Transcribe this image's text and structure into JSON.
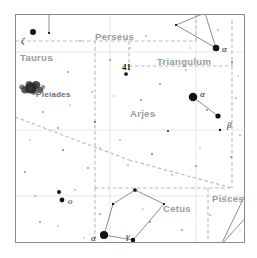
{
  "chart_data": {
    "type": "scatter",
    "xlabel": "",
    "ylabel": "",
    "frame": {
      "x": 15,
      "y": 14,
      "width": 230,
      "height": 229,
      "border_color": "#8a8a8a",
      "background": "#ffffff"
    },
    "constellation_labels": [
      {
        "name": "Perseus",
        "x": 95,
        "y": 31,
        "color": "#9a9a9a"
      },
      {
        "name": "Taurus",
        "x": 20,
        "y": 52,
        "color": "#9a9a9a"
      },
      {
        "name": "Triangulum",
        "x": 157,
        "y": 56,
        "color": "#9a9a9a"
      },
      {
        "name": "Arjes",
        "x": 130,
        "y": 108,
        "color": "#9a9a9a"
      },
      {
        "name": "Cetus",
        "x": 163,
        "y": 203,
        "color": "#9a9a9a"
      },
      {
        "name": "Pisces",
        "x": 212,
        "y": 193,
        "color": "#9a9a9a"
      }
    ],
    "object_labels": [
      {
        "name": "Pleiades",
        "x": 36,
        "y": 90,
        "color": "#6d6d6d"
      }
    ],
    "star_labels": [
      {
        "text": "ζ",
        "x": 21,
        "y": 36,
        "note": "zeta Tauri"
      },
      {
        "text": "41",
        "x": 122,
        "y": 62,
        "note": "41 Arietis",
        "bold": true
      },
      {
        "text": "α",
        "x": 222,
        "y": 44,
        "note": "alpha Trianguli"
      },
      {
        "text": "α",
        "x": 200,
        "y": 89,
        "note": "alpha Arietis / Hamal"
      },
      {
        "text": "β",
        "x": 227,
        "y": 120,
        "note": "beta Arietis"
      },
      {
        "text": "o",
        "x": 68,
        "y": 196,
        "note": "omicron"
      },
      {
        "text": "α",
        "x": 91,
        "y": 233,
        "note": "alpha Ceti"
      },
      {
        "text": "γ",
        "x": 126,
        "y": 231,
        "note": "gamma Ceti"
      }
    ],
    "stars": [
      {
        "x": 33,
        "y": 32,
        "mag": 4.2
      },
      {
        "x": 49,
        "y": 33,
        "mag": 2.4
      },
      {
        "x": 126,
        "y": 74,
        "mag": 3.0
      },
      {
        "x": 205,
        "y": 13,
        "mag": 3.0
      },
      {
        "x": 176,
        "y": 25,
        "mag": 2.4
      },
      {
        "x": 216,
        "y": 48,
        "mag": 4.5
      },
      {
        "x": 193,
        "y": 97,
        "mag": 5.6
      },
      {
        "x": 218,
        "y": 116,
        "mag": 3.8
      },
      {
        "x": 220,
        "y": 130,
        "mag": 2.6
      },
      {
        "x": 59,
        "y": 192,
        "mag": 3.2
      },
      {
        "x": 62,
        "y": 200,
        "mag": 3.6
      },
      {
        "x": 135,
        "y": 190,
        "mag": 3.0
      },
      {
        "x": 113,
        "y": 204,
        "mag": 2.6
      },
      {
        "x": 164,
        "y": 204,
        "mag": 2.4
      },
      {
        "x": 104,
        "y": 235,
        "mag": 5.4
      },
      {
        "x": 133,
        "y": 240,
        "mag": 3.4
      },
      {
        "x": 221,
        "y": 245,
        "mag": 3.0
      },
      {
        "x": 247,
        "y": 191,
        "mag": 3.2
      },
      {
        "x": 168,
        "y": 131,
        "mag": 2.2
      },
      {
        "x": 152,
        "y": 154,
        "mag": 1.6
      },
      {
        "x": 63,
        "y": 150,
        "mag": 1.6
      },
      {
        "x": 95,
        "y": 122,
        "mag": 1.6
      },
      {
        "x": 232,
        "y": 62,
        "mag": 1.6
      },
      {
        "x": 58,
        "y": 128,
        "mag": 1.4
      },
      {
        "x": 88,
        "y": 168,
        "mag": 1.4
      },
      {
        "x": 196,
        "y": 166,
        "mag": 1.4
      },
      {
        "x": 141,
        "y": 100,
        "mag": 1.4
      },
      {
        "x": 110,
        "y": 60,
        "mag": 1.4
      },
      {
        "x": 68,
        "y": 72,
        "mag": 1.4
      },
      {
        "x": 43,
        "y": 112,
        "mag": 1.4
      },
      {
        "x": 100,
        "y": 214,
        "mag": 1.4
      },
      {
        "x": 150,
        "y": 222,
        "mag": 1.4
      },
      {
        "x": 182,
        "y": 230,
        "mag": 1.4
      },
      {
        "x": 40,
        "y": 222,
        "mag": 1.4
      },
      {
        "x": 25,
        "y": 172,
        "mag": 1.4
      },
      {
        "x": 231,
        "y": 157,
        "mag": 1.4
      },
      {
        "x": 207,
        "y": 110,
        "mag": 1.4
      },
      {
        "x": 160,
        "y": 84,
        "mag": 1.4
      },
      {
        "x": 80,
        "y": 41,
        "mag": 1.2
      },
      {
        "x": 146,
        "y": 36,
        "mag": 1.2
      },
      {
        "x": 186,
        "y": 70,
        "mag": 1.2
      },
      {
        "x": 236,
        "y": 98,
        "mag": 1.2
      },
      {
        "x": 120,
        "y": 140,
        "mag": 1.2
      },
      {
        "x": 75,
        "y": 190,
        "mag": 1.2
      },
      {
        "x": 35,
        "y": 196,
        "mag": 1.2
      },
      {
        "x": 210,
        "y": 215,
        "mag": 1.2
      },
      {
        "x": 172,
        "y": 175,
        "mag": 1.2
      },
      {
        "x": 128,
        "y": 165,
        "mag": 1.2
      },
      {
        "x": 92,
        "y": 92,
        "mag": 1.2
      },
      {
        "x": 52,
        "y": 60,
        "mag": 1.2
      },
      {
        "x": 218,
        "y": 30,
        "mag": 1.2
      },
      {
        "x": 240,
        "y": 135,
        "mag": 1.2
      },
      {
        "x": 155,
        "y": 115,
        "mag": 1.0
      },
      {
        "x": 100,
        "y": 148,
        "mag": 1.0
      },
      {
        "x": 70,
        "y": 105,
        "mag": 1.0
      },
      {
        "x": 30,
        "y": 140,
        "mag": 1.0
      },
      {
        "x": 190,
        "y": 48,
        "mag": 1.0
      },
      {
        "x": 238,
        "y": 76,
        "mag": 1.0
      },
      {
        "x": 114,
        "y": 96,
        "mag": 1.0
      },
      {
        "x": 163,
        "y": 63,
        "mag": 1.0
      },
      {
        "x": 200,
        "y": 148,
        "mag": 1.0
      },
      {
        "x": 143,
        "y": 209,
        "mag": 1.0
      },
      {
        "x": 84,
        "y": 238,
        "mag": 1.0
      },
      {
        "x": 58,
        "y": 226,
        "mag": 1.0
      },
      {
        "x": 226,
        "y": 196,
        "mag": 1.0
      },
      {
        "x": 240,
        "y": 230,
        "mag": 1.0
      },
      {
        "x": 20,
        "y": 88,
        "mag": 1.0
      },
      {
        "x": 130,
        "y": 48,
        "mag": 1.0
      }
    ],
    "constellation_lines": [
      {
        "name": "triangulum-a",
        "points": [
          [
            205,
            13
          ],
          [
            216,
            48
          ]
        ]
      },
      {
        "name": "triangulum-b",
        "points": [
          [
            176,
            25
          ],
          [
            216,
            48
          ]
        ]
      },
      {
        "name": "triangulum-c",
        "points": [
          [
            205,
            13
          ],
          [
            176,
            25
          ]
        ]
      },
      {
        "name": "aries",
        "points": [
          [
            193,
            97
          ],
          [
            218,
            116
          ]
        ]
      },
      {
        "name": "cetus-pentagon",
        "points": [
          [
            135,
            190
          ],
          [
            164,
            204
          ],
          [
            133,
            240
          ],
          [
            104,
            235
          ],
          [
            113,
            204
          ],
          [
            135,
            190
          ]
        ]
      },
      {
        "name": "pisces-a",
        "points": [
          [
            221,
            245
          ],
          [
            247,
            191
          ]
        ]
      },
      {
        "name": "pisces-b",
        "points": [
          [
            221,
            245
          ],
          [
            257,
            205
          ]
        ]
      },
      {
        "name": "taurus-zeta",
        "points": [
          [
            49,
            33
          ],
          [
            49,
            14
          ]
        ]
      }
    ],
    "boundaries": [
      {
        "name": "perseus-taurus",
        "points": [
          [
            15,
            41
          ],
          [
            196,
            41
          ]
        ]
      },
      {
        "name": "perseus-vertical",
        "points": [
          [
            196,
            41
          ],
          [
            196,
            14
          ]
        ]
      },
      {
        "name": "aries-upper",
        "points": [
          [
            129,
            41
          ],
          [
            129,
            66
          ]
        ]
      },
      {
        "name": "triangulum-box-top",
        "points": [
          [
            129,
            66
          ],
          [
            232,
            66
          ]
        ]
      },
      {
        "name": "triangulum-box-right",
        "points": [
          [
            232,
            66
          ],
          [
            232,
            20
          ]
        ]
      },
      {
        "name": "aries-pisces-right",
        "points": [
          [
            232,
            66
          ],
          [
            232,
            188
          ]
        ]
      },
      {
        "name": "taurus-aries-diagonal",
        "points": [
          [
            15,
            117
          ],
          [
            129,
            160
          ]
        ]
      },
      {
        "name": "aries-cetus",
        "points": [
          [
            129,
            160
          ],
          [
            232,
            188
          ]
        ]
      },
      {
        "name": "cetus-top",
        "points": [
          [
            95,
            188
          ],
          [
            232,
            188
          ]
        ]
      },
      {
        "name": "cetus-left",
        "points": [
          [
            95,
            188
          ],
          [
            95,
            243
          ]
        ]
      },
      {
        "name": "pisces-left",
        "points": [
          [
            208,
            188
          ],
          [
            208,
            243
          ]
        ]
      },
      {
        "name": "taurus-vertical",
        "points": [
          [
            95,
            41
          ],
          [
            95,
            188
          ]
        ]
      }
    ],
    "grid_lines": [
      {
        "name": "grid-h-1",
        "points": [
          [
            15,
            52
          ],
          [
            245,
            52
          ]
        ]
      },
      {
        "name": "grid-h-2",
        "points": [
          [
            15,
            130
          ],
          [
            245,
            130
          ]
        ]
      },
      {
        "name": "grid-h-3",
        "points": [
          [
            15,
            196
          ],
          [
            245,
            196
          ]
        ]
      },
      {
        "name": "grid-v-1",
        "points": [
          [
            110,
            14
          ],
          [
            110,
            243
          ]
        ]
      },
      {
        "name": "grid-v-2",
        "points": [
          [
            196,
            14
          ],
          [
            196,
            243
          ]
        ]
      }
    ],
    "nebula": {
      "name": "Pleiades",
      "x": 31,
      "y": 88,
      "width": 22,
      "height": 11,
      "color": "#2b2b2b"
    },
    "colors": {
      "star": "#111111",
      "constellation_line": "#8f8f8f",
      "boundary_line": "#b9b9b9",
      "grid_line": "#dedede",
      "frame": "#8a8a8a",
      "label": "#9a9a9a"
    }
  }
}
